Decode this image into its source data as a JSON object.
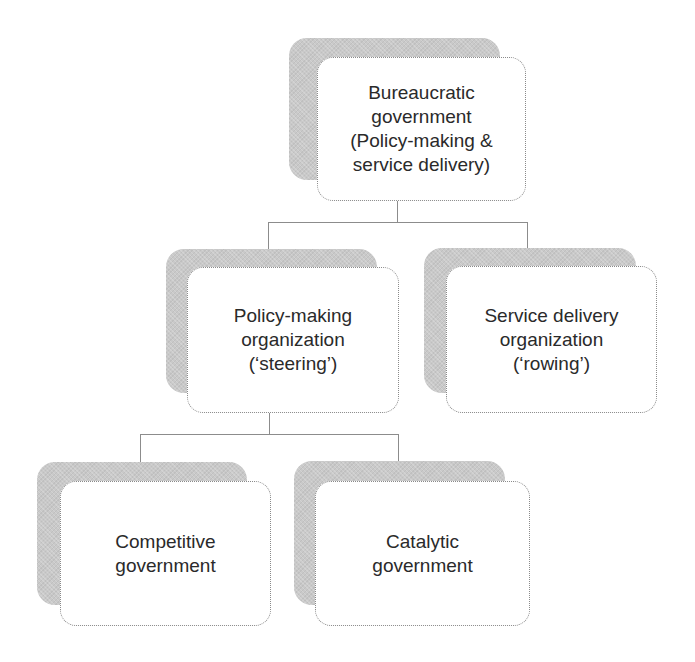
{
  "diagram": {
    "type": "hierarchy",
    "nodes": {
      "root": {
        "label": "Bureaucratic\ngovernment\n(Policy-making &\nservice delivery)"
      },
      "policy": {
        "label": "Policy-making\norganization\n(‘steering’)"
      },
      "service": {
        "label": "Service delivery\norganization\n(‘rowing’)"
      },
      "competitive": {
        "label": "Competitive\ngovernment"
      },
      "catalytic": {
        "label": "Catalytic\ngovernment"
      }
    },
    "edges": [
      [
        "root",
        "policy"
      ],
      [
        "root",
        "service"
      ],
      [
        "policy",
        "competitive"
      ],
      [
        "policy",
        "catalytic"
      ]
    ],
    "colors": {
      "shadow": "#c9c9c9",
      "box_fill": "#ffffff",
      "line": "#8c8c8c",
      "text": "#2a2a2a"
    }
  }
}
